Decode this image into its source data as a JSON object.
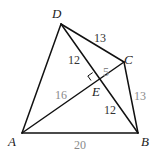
{
  "diagram": {
    "type": "geometry",
    "points": {
      "A": {
        "label": "A",
        "x": 22,
        "y": 133
      },
      "B": {
        "label": "B",
        "x": 138,
        "y": 133
      },
      "C": {
        "label": "C",
        "x": 124,
        "y": 62
      },
      "D": {
        "label": "D",
        "x": 61,
        "y": 24
      },
      "E": {
        "label": "E",
        "x": 97,
        "y": 79
      }
    },
    "segments": [
      {
        "from": "A",
        "to": "B",
        "length": "20"
      },
      {
        "from": "B",
        "to": "C",
        "length": "13"
      },
      {
        "from": "C",
        "to": "D",
        "length": "13"
      },
      {
        "from": "D",
        "to": "A",
        "length": ""
      },
      {
        "from": "A",
        "to": "C",
        "length": ""
      },
      {
        "from": "D",
        "to": "B",
        "length": ""
      },
      {
        "from": "D",
        "to": "E",
        "length": "12"
      },
      {
        "from": "E",
        "to": "B",
        "length": "12"
      },
      {
        "from": "E",
        "to": "C",
        "length": "5"
      },
      {
        "from": "A",
        "to": "E",
        "length": "16"
      }
    ],
    "labels": {
      "vertex_A": "A",
      "vertex_B": "B",
      "vertex_C": "C",
      "vertex_D": "D",
      "vertex_E": "E",
      "len_DC": "13",
      "len_DE": "12",
      "len_EC": "5",
      "len_AE": "16",
      "len_EB": "12",
      "len_CB": "13",
      "len_AB": "20"
    },
    "annotations": [
      "right angle at E between AC and DB"
    ]
  }
}
